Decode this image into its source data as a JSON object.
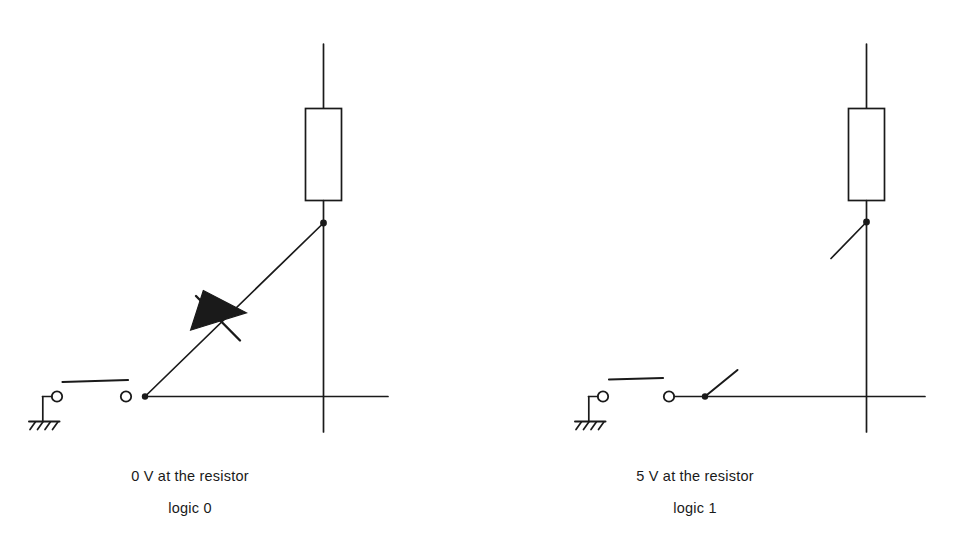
{
  "figure": {
    "stroke_color": "#1a1a1a",
    "fill_color": "#1a1a1a",
    "background_color": "#ffffff",
    "width": 974,
    "height": 549
  },
  "circuits": [
    {
      "id": "left",
      "caption_line1": "0 V at the resistor",
      "caption_line2": "logic 0",
      "components": [
        "ground-symbol",
        "closed-switch",
        "junction-node",
        "diode",
        "resistor",
        "supply-rail-wire",
        "output-wire"
      ],
      "diode_present": true,
      "switch_state": "closed"
    },
    {
      "id": "right",
      "caption_line1": "5 V at the resistor",
      "caption_line2": "logic 1",
      "components": [
        "ground-symbol",
        "open-switch",
        "junction-node",
        "open-branch-stub",
        "resistor",
        "supply-rail-wire",
        "output-wire"
      ],
      "diode_present": false,
      "switch_state": "open"
    }
  ],
  "icon_names": {
    "resistor": "resistor-rectangle-icon",
    "diode": "diode-triangle-icon",
    "ground": "chassis-ground-icon",
    "junction": "junction-dot-icon",
    "terminal": "terminal-circle-icon",
    "switch_bar": "switch-blade-icon"
  }
}
